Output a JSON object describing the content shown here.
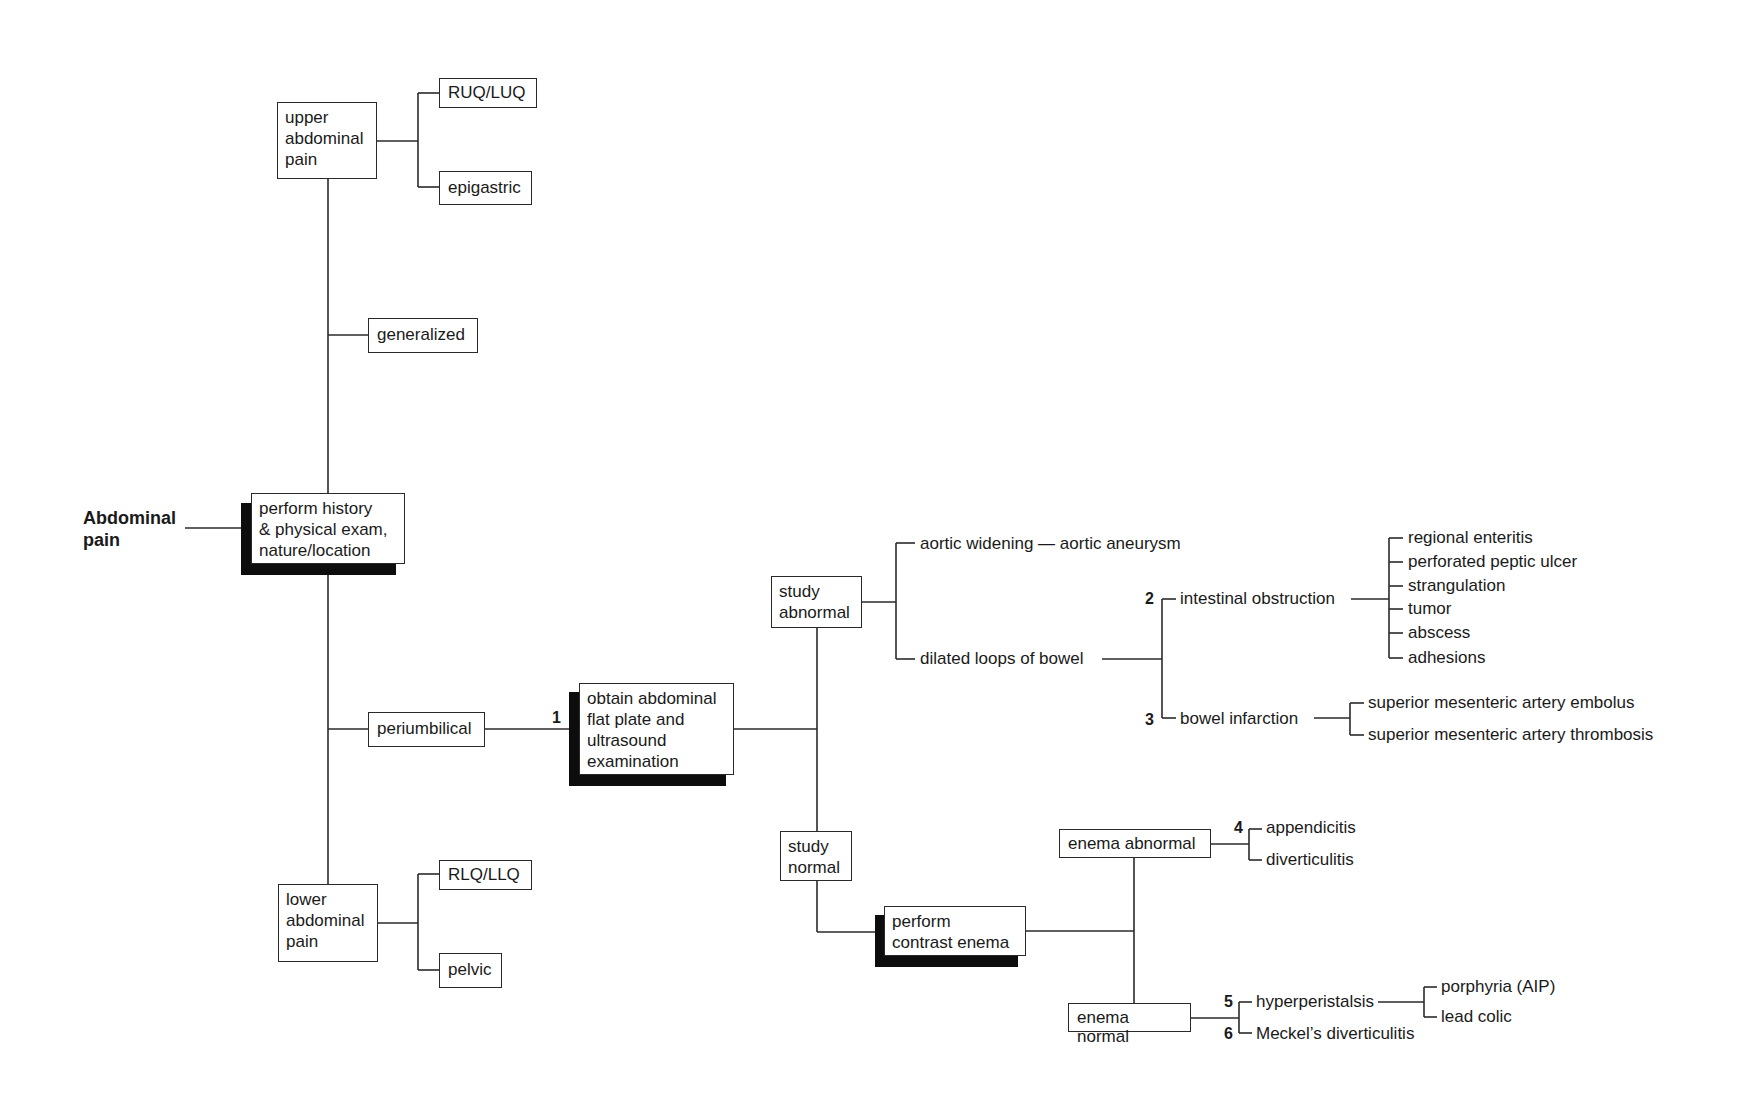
{
  "title": "Abdominal\npain",
  "root": {
    "text": "perform history\n& physical exam,\nnature/location"
  },
  "location_branches": {
    "upper": {
      "text": "upper\nabdominal\npain",
      "children": [
        "RUQ/LUQ",
        "epigastric"
      ]
    },
    "generalized": "generalized",
    "periumbilical": "periumbilical",
    "lower": {
      "text": "lower\nabdominal\npain",
      "children": [
        "RLQ/LLQ",
        "pelvic"
      ]
    }
  },
  "step1": {
    "number": "1",
    "text": "obtain abdominal\nflat plate and\nultrasound\nexamination"
  },
  "study_abnormal": {
    "text": "study\nabnormal",
    "aortic": "aortic widening — aortic aneurysm",
    "dilated": "dilated loops of bowel",
    "obstruction": {
      "number": "2",
      "text": "intestinal obstruction",
      "causes": [
        "regional enteritis",
        "perforated peptic ulcer",
        "strangulation",
        "tumor",
        "abscess",
        "adhesions"
      ]
    },
    "infarction": {
      "number": "3",
      "text": "bowel infarction",
      "causes": [
        "superior mesenteric artery embolus",
        "superior mesenteric artery thrombosis"
      ]
    }
  },
  "study_normal": {
    "text": "study\nnormal",
    "enema": "perform\ncontrast enema",
    "enema_abnormal": {
      "text": "enema abnormal",
      "number": "4",
      "results": [
        "appendicitis",
        "diverticulitis"
      ]
    },
    "enema_normal": {
      "text": "enema normal",
      "hyper": {
        "number": "5",
        "text": "hyperperistalsis",
        "causes": [
          "porphyria (AIP)",
          "lead colic"
        ]
      },
      "meckel": {
        "number": "6",
        "text": "Meckel’s diverticulitis"
      }
    }
  }
}
